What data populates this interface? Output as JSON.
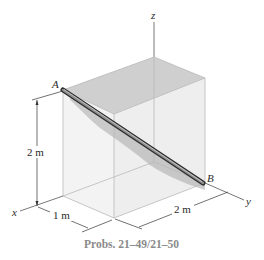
{
  "figure": {
    "caption": "Probs. 21–49/21–50",
    "points": {
      "A": "A",
      "B": "B"
    },
    "axes": {
      "x": "x",
      "y": "y",
      "z": "z"
    },
    "dimensions": {
      "height": "2 m",
      "depth": "1 m",
      "width": "2 m"
    },
    "colors": {
      "box_face": "#f1f1f1",
      "top_face": "#c9c9c9",
      "rod": "#555555",
      "shadow": "#9a9a9a",
      "caption": "#8a8a8a"
    }
  }
}
